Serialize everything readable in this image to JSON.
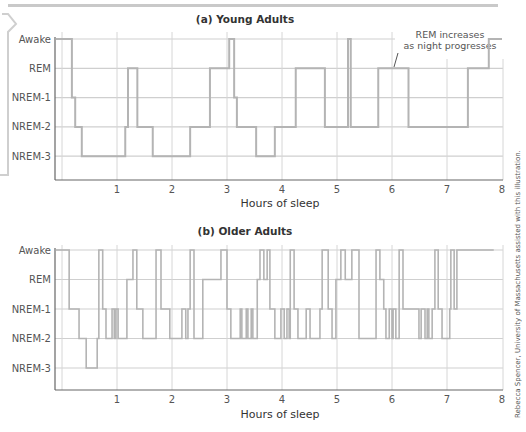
{
  "chart_data": [
    {
      "type": "line",
      "subtype": "step",
      "title": "(a) Young Adults",
      "xlabel": "Hours of sleep",
      "ylabel": "",
      "xlim": [
        0,
        8
      ],
      "x_ticks": [
        "1",
        "2",
        "3",
        "4",
        "5",
        "6",
        "7",
        "8"
      ],
      "y_categories": [
        "Awake",
        "REM",
        "NREM-1",
        "NREM-2",
        "NREM-3"
      ],
      "grid": true,
      "annotation": {
        "lines": [
          "REM increases",
          "as night progresses"
        ],
        "points_to_x": 6.0,
        "points_to_stage": "REM"
      },
      "steps": [
        {
          "x": -0.12,
          "stage": "Awake"
        },
        {
          "x": 0.18,
          "stage": "NREM-1"
        },
        {
          "x": 0.24,
          "stage": "NREM-2"
        },
        {
          "x": 0.36,
          "stage": "NREM-3"
        },
        {
          "x": 1.15,
          "stage": "NREM-2"
        },
        {
          "x": 1.2,
          "stage": "REM"
        },
        {
          "x": 1.37,
          "stage": "NREM-2"
        },
        {
          "x": 1.65,
          "stage": "NREM-3"
        },
        {
          "x": 2.33,
          "stage": "NREM-2"
        },
        {
          "x": 2.69,
          "stage": "REM"
        },
        {
          "x": 3.04,
          "stage": "Awake"
        },
        {
          "x": 3.13,
          "stage": "NREM-1"
        },
        {
          "x": 3.18,
          "stage": "NREM-2"
        },
        {
          "x": 3.53,
          "stage": "NREM-3"
        },
        {
          "x": 3.87,
          "stage": "NREM-2"
        },
        {
          "x": 4.25,
          "stage": "REM"
        },
        {
          "x": 4.78,
          "stage": "NREM-2"
        },
        {
          "x": 5.2,
          "stage": "Awake"
        },
        {
          "x": 5.25,
          "stage": "NREM-2"
        },
        {
          "x": 5.75,
          "stage": "REM"
        },
        {
          "x": 6.3,
          "stage": "NREM-2"
        },
        {
          "x": 7.38,
          "stage": "REM"
        },
        {
          "x": 7.76,
          "stage": "Awake"
        },
        {
          "x": 8.0,
          "stage": "Awake"
        }
      ]
    },
    {
      "type": "line",
      "subtype": "step",
      "title": "(b) Older Adults",
      "xlabel": "Hours of sleep",
      "ylabel": "",
      "xlim": [
        0,
        8
      ],
      "x_ticks": [
        "1",
        "2",
        "3",
        "4",
        "5",
        "6",
        "7",
        "8"
      ],
      "y_categories": [
        "Awake",
        "REM",
        "NREM-1",
        "NREM-2",
        "NREM-3"
      ],
      "grid": true,
      "steps": [
        {
          "x": -0.12,
          "stage": "Awake"
        },
        {
          "x": 0.13,
          "stage": "NREM-1"
        },
        {
          "x": 0.31,
          "stage": "NREM-2"
        },
        {
          "x": 0.44,
          "stage": "NREM-3"
        },
        {
          "x": 0.64,
          "stage": "NREM-2"
        },
        {
          "x": 0.67,
          "stage": "Awake"
        },
        {
          "x": 0.74,
          "stage": "NREM-1"
        },
        {
          "x": 0.8,
          "stage": "NREM-2"
        },
        {
          "x": 0.91,
          "stage": "NREM-1"
        },
        {
          "x": 0.95,
          "stage": "NREM-2"
        },
        {
          "x": 0.98,
          "stage": "NREM-1"
        },
        {
          "x": 1.02,
          "stage": "NREM-2"
        },
        {
          "x": 1.18,
          "stage": "REM"
        },
        {
          "x": 1.29,
          "stage": "Awake"
        },
        {
          "x": 1.36,
          "stage": "NREM-1"
        },
        {
          "x": 1.47,
          "stage": "NREM-2"
        },
        {
          "x": 1.71,
          "stage": "Awake"
        },
        {
          "x": 1.8,
          "stage": "NREM-1"
        },
        {
          "x": 1.96,
          "stage": "NREM-2"
        },
        {
          "x": 2.18,
          "stage": "NREM-1"
        },
        {
          "x": 2.25,
          "stage": "NREM-2"
        },
        {
          "x": 2.29,
          "stage": "NREM-1"
        },
        {
          "x": 2.33,
          "stage": "Awake"
        },
        {
          "x": 2.4,
          "stage": "NREM-2"
        },
        {
          "x": 2.56,
          "stage": "REM"
        },
        {
          "x": 2.89,
          "stage": "Awake"
        },
        {
          "x": 3.0,
          "stage": "NREM-1"
        },
        {
          "x": 3.07,
          "stage": "NREM-2"
        },
        {
          "x": 3.24,
          "stage": "NREM-1"
        },
        {
          "x": 3.27,
          "stage": "NREM-2"
        },
        {
          "x": 3.35,
          "stage": "NREM-1"
        },
        {
          "x": 3.38,
          "stage": "NREM-2"
        },
        {
          "x": 3.44,
          "stage": "NREM-1"
        },
        {
          "x": 3.47,
          "stage": "NREM-2"
        },
        {
          "x": 3.55,
          "stage": "REM"
        },
        {
          "x": 3.6,
          "stage": "Awake"
        },
        {
          "x": 3.67,
          "stage": "REM"
        },
        {
          "x": 3.73,
          "stage": "Awake"
        },
        {
          "x": 3.78,
          "stage": "NREM-1"
        },
        {
          "x": 3.87,
          "stage": "NREM-2"
        },
        {
          "x": 3.98,
          "stage": "NREM-1"
        },
        {
          "x": 4.04,
          "stage": "NREM-2"
        },
        {
          "x": 4.09,
          "stage": "NREM-1"
        },
        {
          "x": 4.13,
          "stage": "NREM-2"
        },
        {
          "x": 4.15,
          "stage": "Awake"
        },
        {
          "x": 4.22,
          "stage": "NREM-1"
        },
        {
          "x": 4.29,
          "stage": "NREM-2"
        },
        {
          "x": 4.44,
          "stage": "NREM-1"
        },
        {
          "x": 4.51,
          "stage": "NREM-2"
        },
        {
          "x": 4.69,
          "stage": "NREM-1"
        },
        {
          "x": 4.73,
          "stage": "Awake"
        },
        {
          "x": 4.84,
          "stage": "NREM-1"
        },
        {
          "x": 4.91,
          "stage": "NREM-2"
        },
        {
          "x": 4.98,
          "stage": "REM"
        },
        {
          "x": 5.07,
          "stage": "Awake"
        },
        {
          "x": 5.15,
          "stage": "REM"
        },
        {
          "x": 5.27,
          "stage": "Awake"
        },
        {
          "x": 5.4,
          "stage": "NREM-2"
        },
        {
          "x": 5.71,
          "stage": "Awake"
        },
        {
          "x": 5.78,
          "stage": "REM"
        },
        {
          "x": 5.85,
          "stage": "NREM-1"
        },
        {
          "x": 5.89,
          "stage": "NREM-2"
        },
        {
          "x": 5.95,
          "stage": "NREM-1"
        },
        {
          "x": 6.0,
          "stage": "NREM-2"
        },
        {
          "x": 6.02,
          "stage": "NREM-1"
        },
        {
          "x": 6.07,
          "stage": "NREM-2"
        },
        {
          "x": 6.13,
          "stage": "Awake"
        },
        {
          "x": 6.2,
          "stage": "NREM-1"
        },
        {
          "x": 6.49,
          "stage": "NREM-2"
        },
        {
          "x": 6.53,
          "stage": "NREM-1"
        },
        {
          "x": 6.6,
          "stage": "NREM-2"
        },
        {
          "x": 6.64,
          "stage": "NREM-1"
        },
        {
          "x": 6.67,
          "stage": "NREM-2"
        },
        {
          "x": 6.73,
          "stage": "NREM-1"
        },
        {
          "x": 6.78,
          "stage": "Awake"
        },
        {
          "x": 6.84,
          "stage": "NREM-1"
        },
        {
          "x": 6.91,
          "stage": "NREM-2"
        },
        {
          "x": 7.05,
          "stage": "NREM-1"
        },
        {
          "x": 7.07,
          "stage": "Awake"
        },
        {
          "x": 7.13,
          "stage": "NREM-1"
        },
        {
          "x": 7.18,
          "stage": "Awake"
        },
        {
          "x": 7.85,
          "stage": "Awake"
        }
      ]
    }
  ],
  "credit": "Rebecca Spencer, University of Massachusetts assisted with this illustration."
}
